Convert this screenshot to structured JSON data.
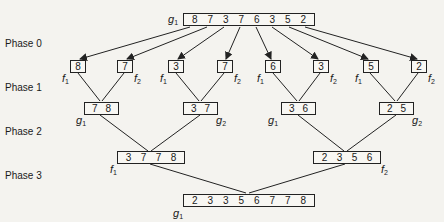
{
  "phases": [
    "Phase 0",
    "Phase 1",
    "Phase 2",
    "Phase 3"
  ],
  "input": {
    "label_base": "g",
    "label_sub": "1",
    "values": [
      "8",
      "7",
      "3",
      "7",
      "6",
      "3",
      "5",
      "2"
    ]
  },
  "phase0": [
    {
      "value": "8",
      "label_base": "f",
      "label_sub": "1"
    },
    {
      "value": "7",
      "label_base": "f",
      "label_sub": "2"
    },
    {
      "value": "3",
      "label_base": "f",
      "label_sub": "1"
    },
    {
      "value": "7",
      "label_base": "f",
      "label_sub": "2"
    },
    {
      "value": "6",
      "label_base": "f",
      "label_sub": "1"
    },
    {
      "value": "3",
      "label_base": "f",
      "label_sub": "2"
    },
    {
      "value": "5",
      "label_base": "f",
      "label_sub": "1"
    },
    {
      "value": "2",
      "label_base": "f",
      "label_sub": "2"
    }
  ],
  "phase1": [
    {
      "values": [
        "7",
        "8"
      ],
      "label_base": "g",
      "label_sub": "1"
    },
    {
      "values": [
        "3",
        "7"
      ],
      "label_base": "g",
      "label_sub": "2"
    },
    {
      "values": [
        "3",
        "6"
      ],
      "label_base": "g",
      "label_sub": "1"
    },
    {
      "values": [
        "2",
        "5"
      ],
      "label_base": "g",
      "label_sub": "2"
    }
  ],
  "phase2": [
    {
      "values": [
        "3",
        "7",
        "7",
        "8"
      ],
      "label_base": "f",
      "label_sub": "1"
    },
    {
      "values": [
        "2",
        "3",
        "5",
        "6"
      ],
      "label_base": "f",
      "label_sub": "2"
    }
  ],
  "phase3": {
    "values": [
      "2",
      "3",
      "3",
      "5",
      "6",
      "7",
      "7",
      "8"
    ],
    "label_base": "g",
    "label_sub": "1"
  }
}
